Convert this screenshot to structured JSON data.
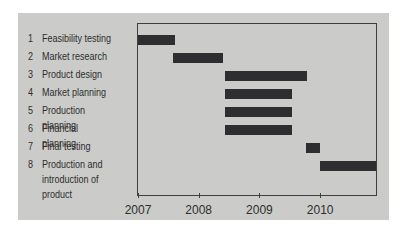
{
  "figure": {
    "kind": "gantt-chart-figure",
    "background_color": "#ffffff",
    "panel_color": "#cbcbc9",
    "bar_color": "#2e2e31",
    "axis_color": "#3f3f3f",
    "text_color": "#2e2e2e"
  },
  "chart_data": {
    "type": "bar",
    "subtype": "gantt",
    "title": "",
    "xlabel": "",
    "ylabel": "",
    "grid": false,
    "legend": "none",
    "x_axis": {
      "unit": "year",
      "min": 2007,
      "max": 2010.92,
      "ticks": [
        2007,
        2008,
        2009,
        2010
      ],
      "tick_labels": [
        "2007",
        "2008",
        "2009",
        "2010"
      ]
    },
    "tasks": [
      {
        "number": "1",
        "label": "Feasibility testing",
        "start": 2007.0,
        "end": 2007.61
      },
      {
        "number": "2",
        "label": "Market research",
        "start": 2007.58,
        "end": 2008.4
      },
      {
        "number": "3",
        "label": "Product design",
        "start": 2008.44,
        "end": 2009.79
      },
      {
        "number": "4",
        "label": "Market planning",
        "start": 2008.44,
        "end": 2009.54
      },
      {
        "number": "5",
        "label": "Production planning",
        "start": 2008.44,
        "end": 2009.54
      },
      {
        "number": "6",
        "label": "Financial planning",
        "start": 2008.44,
        "end": 2009.54
      },
      {
        "number": "7",
        "label": "Final testing",
        "start": 2009.76,
        "end": 2010.0
      },
      {
        "number": "8",
        "label": "Production and introduction of product",
        "start": 2010.0,
        "end": 2010.92
      }
    ]
  }
}
